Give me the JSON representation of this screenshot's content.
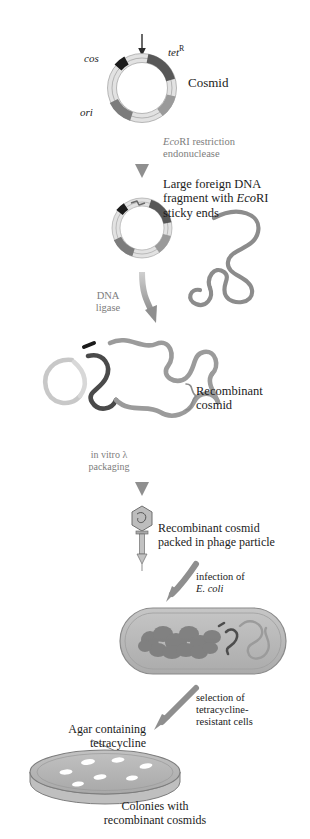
{
  "figure": {
    "colors": {
      "dna_gray": "#8c8c8c",
      "dna_dark": "#4a4a4a",
      "segment_dark": "#5a5a5a",
      "segment_black": "#1b1b1b",
      "segment_light": "#e8e8e8",
      "arrow_gray": "#9a9a9a",
      "cell_fill": "#b9b9b9",
      "dish_fill": "#b5b5b5",
      "colony_white": "#ffffff",
      "text_dark": "#1b1b1b",
      "text_gray": "#7d7d7d"
    }
  },
  "labels": {
    "cos": "cos",
    "tet": "tet",
    "tet_sup": "R",
    "ori": "ori",
    "cosmid": "Cosmid",
    "ecori_line1_italic": "Eco",
    "ecori_line1_rest": "RI restriction",
    "ecori_line2": "endonuclease",
    "large_line1": "Large foreign DNA",
    "large_line2_pre": "fragment with ",
    "large_line2_italic": "Eco",
    "large_line2_post": "RI",
    "large_line3": "sticky ends",
    "ligase_line1": "DNA",
    "ligase_line2": "ligase",
    "recombinant_line1": "Recombinant",
    "recombinant_line2": "cosmid",
    "packaging_line1": "in vitro λ",
    "packaging_line2": "packaging",
    "phage_line1": "Recombinant cosmid",
    "phage_line2": "packed in phage particle",
    "infection_line1": "infection of",
    "infection_line2_italic": "E. coli",
    "selection_line1": "selection of",
    "selection_line2": "tetracycline-",
    "selection_line3": "resistant cells",
    "agar_line1": "Agar containing",
    "agar_line2": "tetracycline",
    "colonies_line1": "Colonies with",
    "colonies_line2": "recombinant cosmids"
  },
  "icons": {
    "cut_arrow": "cut-site-arrow-icon",
    "process_arrow": "downward-process-arrow-icon",
    "curved_arrow": "curved-process-arrow-icon",
    "cosmid_circle": "circular-cosmid-icon",
    "linear_cosmid": "cut-cosmid-icon",
    "foreign_dna": "foreign-dna-strand-icon",
    "recombinant_dna": "recombinant-cosmid-strand-icon",
    "phage": "bacteriophage-particle-icon",
    "ecoli_cell": "ecoli-cell-icon",
    "petri_dish": "petri-dish-icon"
  },
  "counts": {
    "colonies": 7
  }
}
